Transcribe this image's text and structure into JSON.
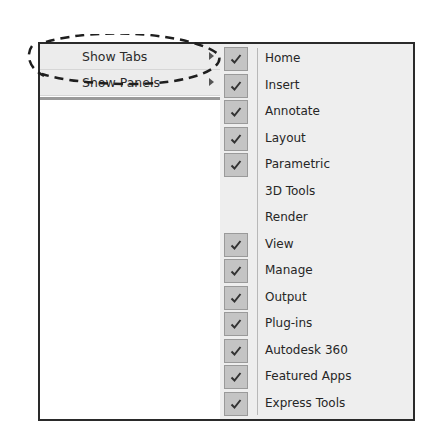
{
  "left_menu": {
    "items": [
      {
        "label": "Show Tabs",
        "has_submenu": true,
        "highlighted": true
      },
      {
        "label": "Show Panels",
        "has_submenu": true,
        "highlighted": false
      }
    ]
  },
  "submenu": {
    "items": [
      {
        "label": "Home",
        "checked": true
      },
      {
        "label": "Insert",
        "checked": true
      },
      {
        "label": "Annotate",
        "checked": true
      },
      {
        "label": "Layout",
        "checked": true
      },
      {
        "label": "Parametric",
        "checked": true
      },
      {
        "label": "3D Tools",
        "checked": false
      },
      {
        "label": "Render",
        "checked": false
      },
      {
        "label": "View",
        "checked": true
      },
      {
        "label": "Manage",
        "checked": true
      },
      {
        "label": "Output",
        "checked": true
      },
      {
        "label": "Plug-ins",
        "checked": true
      },
      {
        "label": "Autodesk 360",
        "checked": true
      },
      {
        "label": "Featured Apps",
        "checked": true
      },
      {
        "label": "Express Tools",
        "checked": true
      }
    ]
  },
  "annotation": {
    "shape": "dashed-ellipse",
    "target": "Show Tabs"
  }
}
